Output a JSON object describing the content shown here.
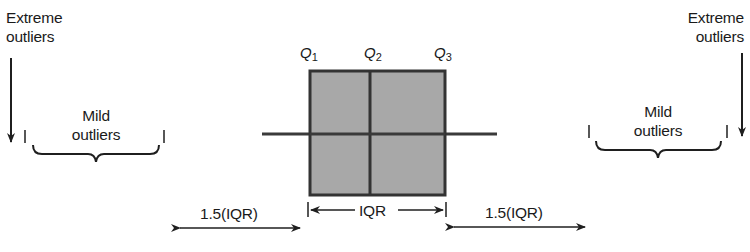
{
  "diagram": {
    "type": "box-plot-explanation",
    "colors": {
      "box_fill": "#a8a8a8",
      "stroke": "#2f2f2f",
      "text": "#1a1a1a"
    },
    "quartiles": [
      {
        "symbol": "Q",
        "sub": "1"
      },
      {
        "symbol": "Q",
        "sub": "2"
      },
      {
        "symbol": "Q",
        "sub": "3"
      }
    ],
    "left": {
      "extreme_label_line1": "Extreme",
      "extreme_label_line2": "outliers",
      "mild_label_line1": "Mild",
      "mild_label_line2": "outliers",
      "fence_label": "1.5(IQR)"
    },
    "right": {
      "extreme_label_line1": "Extreme",
      "extreme_label_line2": "outliers",
      "mild_label_line1": "Mild",
      "mild_label_line2": "outliers",
      "fence_label": "1.5(IQR)"
    },
    "iqr_label": "IQR"
  }
}
